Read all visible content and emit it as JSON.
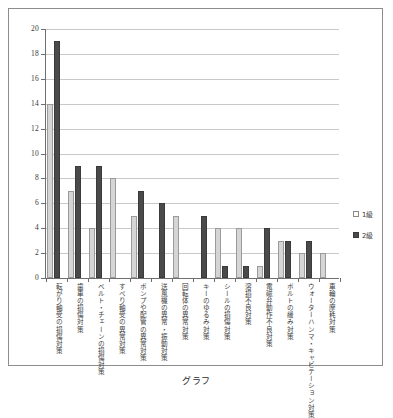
{
  "caption": "グラフ",
  "legend": {
    "position": "right",
    "items": [
      {
        "label": "1級",
        "color": "#d5d5d5",
        "swatch": "s1"
      },
      {
        "label": "2級",
        "color": "#4a4a4a",
        "swatch": "s2"
      }
    ]
  },
  "axis": {
    "y_ticks": [
      "0",
      "2",
      "4",
      "6",
      "8",
      "10",
      "12",
      "14",
      "16",
      "18",
      "20"
    ]
  },
  "chart_data": {
    "type": "bar",
    "title": "グラフ",
    "xlabel": "",
    "ylabel": "",
    "ylim": [
      0,
      20
    ],
    "ytick_step": 2,
    "grid": true,
    "legend_position": "right",
    "categories": [
      "転がり軸受の損傷対策",
      "歯車の損傷対策",
      "ベルト・チェーンの損傷対策",
      "すべり軸受の異常対策",
      "ポンプや配管の異常対策",
      "送風機の異常・振動対策",
      "回転体の異常対策",
      "キーのゆるみ対策",
      "シールの損傷対策",
      "溶損不良対策",
      "電磁弁動作不良対策",
      "ボルトの緩み対策",
      "ウォーターハンマ・キャビテーション対策",
      "車輪の摩耗対策"
    ],
    "series": [
      {
        "name": "1級",
        "color": "#d5d5d5",
        "values": [
          14,
          7,
          4,
          8,
          5,
          0,
          5,
          0,
          4,
          4,
          1,
          3,
          2,
          2
        ]
      },
      {
        "name": "2級",
        "color": "#4a4a4a",
        "values": [
          19,
          9,
          9,
          0,
          7,
          6,
          0,
          5,
          1,
          1,
          4,
          3,
          3,
          0
        ]
      }
    ]
  }
}
